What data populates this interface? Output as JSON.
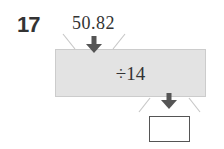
{
  "problem": {
    "number": "17",
    "input_value": "50.82",
    "operation": "÷14",
    "answer": ""
  },
  "icons": {
    "input_arrow": "arrow-down-icon",
    "output_arrow": "arrow-down-icon"
  },
  "colors": {
    "box_fill": "#e3e3e3",
    "arrow": "#555555",
    "text": "#333333",
    "guide_lines": "#c8c8c8"
  }
}
